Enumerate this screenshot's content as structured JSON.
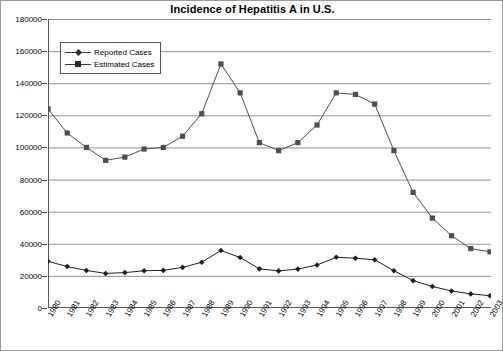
{
  "chart_data": {
    "type": "line",
    "title": "Incidence of Hepatitis A in U.S.",
    "xlabel": "",
    "ylabel": "",
    "ylim": [
      0,
      180000
    ],
    "ytick_step": 20000,
    "yticks": [
      0,
      20000,
      40000,
      60000,
      80000,
      100000,
      120000,
      140000,
      160000,
      180000
    ],
    "ytick_labels": [
      "0",
      "20000",
      "40000",
      "60000",
      "80000",
      "100000",
      "120000",
      "140000",
      "160000",
      "180000"
    ],
    "grid": true,
    "grid_axis": "y",
    "legend_position": "upper-left",
    "categories": [
      "1980",
      "1981",
      "1982",
      "1983",
      "1984",
      "1985",
      "1986",
      "1987",
      "1988",
      "1989",
      "1990",
      "1991",
      "1992",
      "1993",
      "1994",
      "1995",
      "1996",
      "1997",
      "1998",
      "1999",
      "2000",
      "2001",
      "2002",
      "2003"
    ],
    "series": [
      {
        "name": "Reported Cases",
        "marker": "diamond",
        "color": "#1f1f1f",
        "values": [
          29087,
          25802,
          23403,
          21532,
          22040,
          23210,
          23430,
          25280,
          28507,
          35821,
          31441,
          24378,
          23112,
          24238,
          26796,
          31582,
          31032,
          30021,
          23229,
          17047,
          13397,
          10615,
          8795,
          7653
        ]
      },
      {
        "name": "Estimated Cases",
        "marker": "square",
        "color": "#4d4d4d",
        "values": [
          124000,
          109000,
          100000,
          92000,
          94000,
          99000,
          100000,
          107000,
          121000,
          152000,
          134000,
          103000,
          98000,
          103000,
          114000,
          134000,
          133000,
          127000,
          98000,
          72000,
          56000,
          45000,
          37000,
          35000
        ]
      }
    ]
  },
  "legend": {
    "items": [
      {
        "label": "Reported Cases"
      },
      {
        "label": "Estimated Cases"
      }
    ]
  }
}
